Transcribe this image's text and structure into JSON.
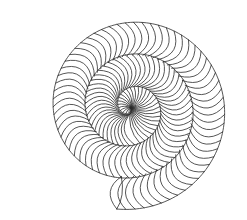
{
  "image": {
    "subject": "spiral line drawing",
    "caption": "",
    "background_color": "#ffffff",
    "stroke_color": "#2b2b2b"
  },
  "spiral": {
    "center_x": 131,
    "center_y": 108,
    "start_radius": 2,
    "end_radius": 102,
    "turns": 3.05,
    "start_angle_deg": 80,
    "rib_count": 150,
    "rib_curl": 0.55,
    "stroke_width": 0.8
  }
}
